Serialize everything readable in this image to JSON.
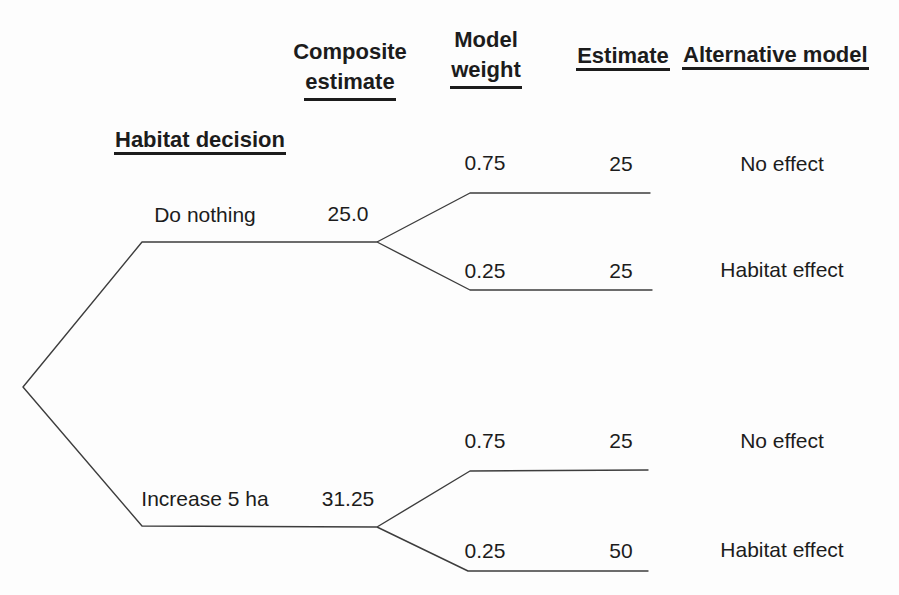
{
  "figure": {
    "background_color": "#fdfdfd",
    "text_color": "#1c1c1c",
    "line_color": "#3d3d3d"
  },
  "headers": {
    "habitat_decision": "Habitat decision",
    "composite_estimate_line1": "Composite",
    "composite_estimate_line2": "estimate",
    "model_weight_line1": "Model",
    "model_weight_line2": "weight",
    "estimate": "Estimate",
    "alternative_model": "Alternative model"
  },
  "decisions": [
    {
      "label": "Do nothing",
      "composite_estimate": "25.0",
      "branches": [
        {
          "model_weight": "0.75",
          "estimate": "25",
          "alternative_model": "No effect"
        },
        {
          "model_weight": "0.25",
          "estimate": "25",
          "alternative_model": "Habitat effect"
        }
      ]
    },
    {
      "label": "Increase 5 ha",
      "composite_estimate": "31.25",
      "branches": [
        {
          "model_weight": "0.75",
          "estimate": "25",
          "alternative_model": "No effect"
        },
        {
          "model_weight": "0.25",
          "estimate": "50",
          "alternative_model": "Habitat effect"
        }
      ]
    }
  ]
}
